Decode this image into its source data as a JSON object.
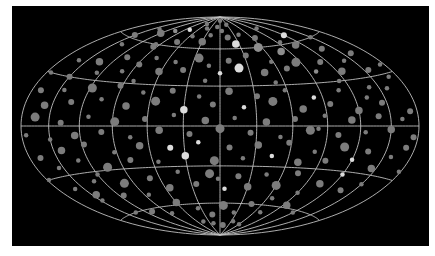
{
  "map": {
    "projection": "hammer",
    "center_x": 220,
    "center_y": 126,
    "half_width": 199,
    "half_height": 109,
    "meridian_step_deg": 30,
    "parallel_step_deg": 30,
    "colors": {
      "background": "#ffffff",
      "panel": "#000000",
      "grid": "#bfbfbf",
      "dot_dim": "#7c7c7c",
      "dot_mid": "#8e8e8e",
      "dot_bright": "#dcdcdc"
    }
  },
  "dots": [
    [
      -150,
      62,
      4,
      0
    ],
    [
      -140,
      55,
      3,
      0
    ],
    [
      -120,
      68,
      5,
      0
    ],
    [
      -105,
      72,
      3,
      1
    ],
    [
      -95,
      58,
      4,
      0
    ],
    [
      -80,
      75,
      3,
      2
    ],
    [
      -70,
      64,
      4,
      0
    ],
    [
      -55,
      70,
      3,
      0
    ],
    [
      -40,
      78,
      3,
      0
    ],
    [
      -30,
      66,
      5,
      0
    ],
    [
      -20,
      72,
      3,
      0
    ],
    [
      -10,
      80,
      3,
      0
    ],
    [
      5,
      76,
      3,
      0
    ],
    [
      15,
      70,
      4,
      0
    ],
    [
      25,
      64,
      5,
      2
    ],
    [
      40,
      72,
      3,
      0
    ],
    [
      55,
      60,
      6,
      1
    ],
    [
      65,
      68,
      4,
      0
    ],
    [
      80,
      55,
      5,
      1
    ],
    [
      95,
      62,
      3,
      0
    ],
    [
      110,
      58,
      5,
      0
    ],
    [
      120,
      66,
      4,
      2
    ],
    [
      135,
      52,
      4,
      0
    ],
    [
      150,
      60,
      3,
      0
    ],
    [
      160,
      45,
      4,
      0
    ],
    [
      -160,
      40,
      3,
      0
    ],
    [
      -150,
      30,
      4,
      0
    ],
    [
      -135,
      42,
      5,
      0
    ],
    [
      -125,
      35,
      3,
      0
    ],
    [
      -110,
      48,
      4,
      0
    ],
    [
      -100,
      38,
      3,
      0
    ],
    [
      -88,
      44,
      4,
      0
    ],
    [
      -75,
      50,
      3,
      0
    ],
    [
      -62,
      40,
      5,
      0
    ],
    [
      -50,
      48,
      3,
      0
    ],
    [
      -38,
      42,
      4,
      0
    ],
    [
      -25,
      52,
      6,
      0
    ],
    [
      -12,
      46,
      3,
      0
    ],
    [
      0,
      40,
      3,
      2
    ],
    [
      10,
      50,
      4,
      0
    ],
    [
      20,
      44,
      6,
      2
    ],
    [
      32,
      54,
      4,
      0
    ],
    [
      45,
      40,
      5,
      0
    ],
    [
      58,
      48,
      3,
      0
    ],
    [
      70,
      42,
      4,
      0
    ],
    [
      85,
      46,
      6,
      0
    ],
    [
      98,
      38,
      3,
      1
    ],
    [
      112,
      44,
      4,
      0
    ],
    [
      125,
      36,
      5,
      0
    ],
    [
      140,
      42,
      3,
      0
    ],
    [
      155,
      34,
      4,
      0
    ],
    [
      170,
      28,
      3,
      0
    ],
    [
      -170,
      20,
      4,
      0
    ],
    [
      -158,
      12,
      5,
      0
    ],
    [
      -145,
      22,
      3,
      0
    ],
    [
      -132,
      15,
      4,
      0
    ],
    [
      -118,
      25,
      6,
      0
    ],
    [
      -104,
      18,
      3,
      0
    ],
    [
      -92,
      28,
      4,
      0
    ],
    [
      -80,
      14,
      5,
      0
    ],
    [
      -68,
      24,
      3,
      0
    ],
    [
      -55,
      18,
      6,
      0
    ],
    [
      -42,
      26,
      4,
      0
    ],
    [
      -30,
      12,
      5,
      2
    ],
    [
      -18,
      22,
      3,
      0
    ],
    [
      -6,
      16,
      4,
      0
    ],
    [
      8,
      26,
      5,
      0
    ],
    [
      20,
      14,
      3,
      2
    ],
    [
      32,
      22,
      4,
      0
    ],
    [
      45,
      18,
      6,
      0
    ],
    [
      58,
      26,
      3,
      0
    ],
    [
      70,
      12,
      5,
      0
    ],
    [
      82,
      20,
      3,
      2
    ],
    [
      95,
      15,
      4,
      0
    ],
    [
      108,
      24,
      3,
      0
    ],
    [
      120,
      10,
      5,
      0
    ],
    [
      132,
      18,
      3,
      0
    ],
    [
      145,
      14,
      4,
      0
    ],
    [
      158,
      22,
      3,
      0
    ],
    [
      172,
      8,
      4,
      0
    ],
    [
      -175,
      -5,
      3,
      0
    ],
    [
      -165,
      5,
      6,
      0
    ],
    [
      -150,
      -8,
      3,
      0
    ],
    [
      -138,
      2,
      4,
      0
    ],
    [
      -125,
      -6,
      5,
      0
    ],
    [
      -112,
      6,
      3,
      0
    ],
    [
      -100,
      -4,
      4,
      0
    ],
    [
      -88,
      3,
      6,
      0
    ],
    [
      -75,
      -8,
      3,
      0
    ],
    [
      -62,
      5,
      4,
      0
    ],
    [
      -50,
      -3,
      5,
      0
    ],
    [
      -38,
      8,
      3,
      0
    ],
    [
      -25,
      -6,
      4,
      0
    ],
    [
      -12,
      4,
      5,
      0
    ],
    [
      0,
      -2,
      6,
      0
    ],
    [
      12,
      6,
      3,
      0
    ],
    [
      25,
      -5,
      4,
      0
    ],
    [
      38,
      3,
      5,
      0
    ],
    [
      50,
      -8,
      3,
      0
    ],
    [
      62,
      5,
      4,
      0
    ],
    [
      75,
      -3,
      6,
      0
    ],
    [
      88,
      7,
      3,
      0
    ],
    [
      100,
      -6,
      4,
      0
    ],
    [
      112,
      4,
      5,
      0
    ],
    [
      125,
      -4,
      3,
      0
    ],
    [
      138,
      6,
      4,
      0
    ],
    [
      150,
      -2,
      5,
      0
    ],
    [
      162,
      4,
      3,
      0
    ],
    [
      175,
      -6,
      4,
      0
    ],
    [
      -168,
      -18,
      4,
      0
    ],
    [
      -155,
      -25,
      3,
      0
    ],
    [
      -142,
      -15,
      5,
      0
    ],
    [
      -130,
      -22,
      3,
      0
    ],
    [
      -118,
      -12,
      4,
      0
    ],
    [
      -105,
      -28,
      6,
      0
    ],
    [
      -92,
      -18,
      3,
      0
    ],
    [
      -80,
      -24,
      4,
      0
    ],
    [
      -68,
      -14,
      5,
      0
    ],
    [
      -55,
      -26,
      3,
      0
    ],
    [
      -42,
      -16,
      4,
      2
    ],
    [
      -30,
      -22,
      5,
      2
    ],
    [
      -18,
      -12,
      3,
      2
    ],
    [
      -5,
      -26,
      6,
      0
    ],
    [
      8,
      -16,
      4,
      0
    ],
    [
      20,
      -24,
      3,
      0
    ],
    [
      32,
      -14,
      5,
      0
    ],
    [
      45,
      -22,
      3,
      2
    ],
    [
      58,
      -12,
      4,
      0
    ],
    [
      70,
      -26,
      5,
      0
    ],
    [
      82,
      -18,
      3,
      0
    ],
    [
      95,
      -24,
      4,
      0
    ],
    [
      108,
      -14,
      6,
      0
    ],
    [
      120,
      -22,
      3,
      2
    ],
    [
      132,
      -16,
      4,
      0
    ],
    [
      145,
      -26,
      5,
      0
    ],
    [
      158,
      -18,
      3,
      0
    ],
    [
      170,
      -12,
      4,
      0
    ],
    [
      -160,
      -38,
      3,
      0
    ],
    [
      -145,
      -44,
      5,
      0
    ],
    [
      -130,
      -36,
      3,
      0
    ],
    [
      -115,
      -48,
      4,
      0
    ],
    [
      -100,
      -40,
      6,
      0
    ],
    [
      -85,
      -50,
      3,
      0
    ],
    [
      -70,
      -38,
      4,
      0
    ],
    [
      -55,
      -46,
      5,
      0
    ],
    [
      -40,
      -34,
      3,
      0
    ],
    [
      -25,
      -44,
      4,
      0
    ],
    [
      -10,
      -36,
      6,
      0
    ],
    [
      5,
      -48,
      3,
      2
    ],
    [
      18,
      -38,
      4,
      0
    ],
    [
      30,
      -46,
      5,
      0
    ],
    [
      45,
      -36,
      3,
      0
    ],
    [
      60,
      -44,
      6,
      0
    ],
    [
      75,
      -34,
      4,
      0
    ],
    [
      90,
      -48,
      3,
      0
    ],
    [
      105,
      -40,
      5,
      0
    ],
    [
      120,
      -32,
      3,
      2
    ],
    [
      135,
      -42,
      4,
      0
    ],
    [
      150,
      -36,
      3,
      0
    ],
    [
      -135,
      -60,
      3,
      0
    ],
    [
      -110,
      -62,
      4,
      0
    ],
    [
      -85,
      -66,
      3,
      0
    ],
    [
      -60,
      -58,
      5,
      0
    ],
    [
      -35,
      -64,
      3,
      0
    ],
    [
      -15,
      -70,
      4,
      0
    ],
    [
      5,
      -62,
      6,
      0
    ],
    [
      25,
      -68,
      3,
      0
    ],
    [
      45,
      -60,
      4,
      0
    ],
    [
      70,
      -66,
      3,
      0
    ],
    [
      95,
      -58,
      5,
      0
    ],
    [
      120,
      -62,
      3,
      0
    ],
    [
      -20,
      -78,
      3,
      0
    ],
    [
      10,
      -80,
      4,
      0
    ],
    [
      35,
      -76,
      3,
      0
    ],
    [
      -45,
      -76,
      3,
      0
    ],
    [
      60,
      -78,
      3,
      0
    ],
    [
      -140,
      70,
      3,
      0
    ],
    [
      -60,
      82,
      3,
      0
    ],
    [
      0,
      86,
      3,
      0
    ],
    [
      100,
      75,
      3,
      0
    ],
    [
      -175,
      30,
      3,
      0
    ],
    [
      175,
      35,
      3,
      0
    ],
    [
      -178,
      -30,
      3,
      0
    ],
    [
      178,
      -25,
      3,
      0
    ],
    [
      -82,
      32,
      3,
      0
    ],
    [
      -14,
      34,
      3,
      0
    ],
    [
      52,
      32,
      3,
      0
    ],
    [
      114,
      30,
      3,
      0
    ],
    [
      -120,
      -32,
      3,
      0
    ],
    [
      -2,
      -40,
      3,
      0
    ],
    [
      66,
      -54,
      3,
      0
    ],
    [
      -96,
      60,
      3,
      0
    ],
    [
      28,
      82,
      3,
      0
    ],
    [
      140,
      24,
      3,
      0
    ],
    [
      -148,
      -48,
      3,
      0
    ],
    [
      82,
      -2,
      3,
      0
    ]
  ]
}
